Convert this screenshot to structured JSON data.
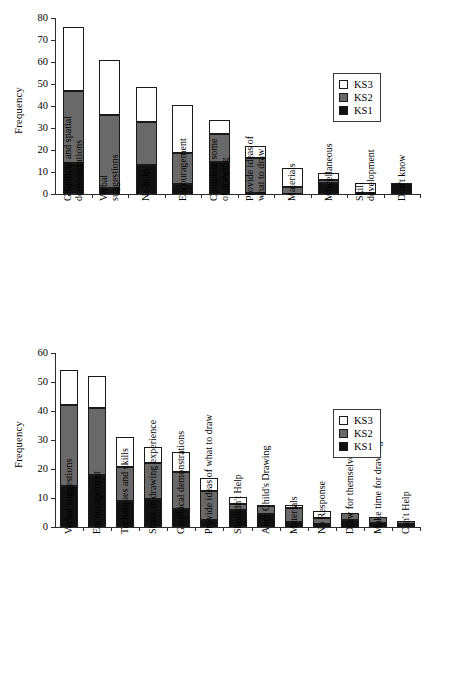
{
  "figure": {
    "background": "#ffffff",
    "colors": {
      "ks1": "#111111",
      "ks2": "#696969",
      "ks3": "#ffffff",
      "axis": "#2b2b2b"
    }
  },
  "legend": {
    "position": "top-right",
    "items": [
      {
        "label": "KS3",
        "color": "#ffffff"
      },
      {
        "label": "KS2",
        "color": "#696969"
      },
      {
        "label": "KS1",
        "color": "#111111"
      }
    ]
  },
  "chart_data": [
    {
      "id": "top",
      "type": "bar",
      "stacked": true,
      "title": "",
      "xlabel": "",
      "ylabel": "Frequency",
      "ylim": [
        0,
        80
      ],
      "yticks": [
        0,
        10,
        20,
        30,
        40,
        50,
        60,
        70,
        80
      ],
      "ytick_labels": [
        "0",
        "10",
        "20",
        "30",
        "40",
        "50",
        "60",
        "70",
        "80"
      ],
      "grid": false,
      "legend_entries": [
        "KS3",
        "KS2",
        "KS1"
      ],
      "categories": [
        "Graphical and spatial demonstrations",
        "Verbal suggestions",
        "No help",
        "Encouragement",
        "Complete some of drawing",
        "Provide ideas of what to draw",
        "Materials",
        "Miscellaneous",
        "Skill development",
        "Don't know"
      ],
      "category_lines": [
        [
          "Graphical and spatial",
          "demonstrations"
        ],
        [
          "Verbal",
          "suggestions"
        ],
        [
          "No help"
        ],
        [
          "Encouragement"
        ],
        [
          "Complete some",
          "of drawing"
        ],
        [
          "Provide ideas of",
          "what to draw"
        ],
        [
          "Materials"
        ],
        [
          "Miscellaneous"
        ],
        [
          "Skill",
          "development"
        ],
        [
          "Don't know"
        ]
      ],
      "series": [
        {
          "name": "KS1",
          "values": [
            14,
            3,
            13,
            4.5,
            14.5,
            0.5,
            0,
            5,
            0,
            5
          ]
        },
        {
          "name": "KS2",
          "values": [
            33,
            33,
            19.5,
            14,
            12.5,
            16,
            3.5,
            1.5,
            0.5,
            0
          ]
        },
        {
          "name": "KS3",
          "values": [
            29,
            25,
            16,
            22,
            6.5,
            5.5,
            8.5,
            3,
            4.5,
            0
          ]
        }
      ],
      "totals": [
        76,
        61,
        48.5,
        40.5,
        33.5,
        22,
        12,
        9.5,
        5,
        5
      ]
    },
    {
      "id": "bottom",
      "type": "bar",
      "stacked": true,
      "title": "",
      "xlabel": "",
      "ylabel": "Frequency",
      "ylim": [
        0,
        60
      ],
      "yticks": [
        0,
        10,
        20,
        30,
        40,
        50,
        60
      ],
      "ytick_labels": [
        "0",
        "10",
        "20",
        "30",
        "40",
        "50",
        "60"
      ],
      "grid": false,
      "legend_entries": [
        "KS3",
        "KS2",
        "KS1"
      ],
      "categories": [
        "Verbal suggestions",
        "Encouragement",
        "Techniques and skills",
        "Share in drawing experience",
        "Graphical demonstrations",
        "Provide ideas of what to draw",
        "Shouldn't Help",
        "Alter Child's Drawing",
        "Materials",
        "No Response",
        "Draw for themselves",
        "Make time for drawing",
        "Can't Help"
      ],
      "category_lines": [
        [
          "Verbal suggestions"
        ],
        [
          "Encouragement"
        ],
        [
          "Techniques and skills"
        ],
        [
          "Share in drawing experience"
        ],
        [
          "Graphical demonstrations"
        ],
        [
          "Provide ideas of what to draw"
        ],
        [
          "Shouldn't Help"
        ],
        [
          "Alter Child's Drawing"
        ],
        [
          "Materials"
        ],
        [
          "No Response"
        ],
        [
          "Draw for themselves"
        ],
        [
          "Make time for drawing"
        ],
        [
          "Can't Help"
        ]
      ],
      "series": [
        {
          "name": "KS1",
          "values": [
            14,
            18,
            9,
            9.5,
            6.5,
            2.5,
            6,
            4.5,
            1.5,
            1,
            2.5,
            1.5,
            1
          ]
        },
        {
          "name": "KS2",
          "values": [
            28,
            23,
            11.5,
            12.5,
            12.5,
            10,
            2,
            2.5,
            5,
            2,
            2.5,
            2,
            1
          ]
        },
        {
          "name": "KS3",
          "values": [
            12,
            11,
            10.5,
            5.5,
            7,
            4.5,
            2.5,
            0.5,
            1,
            2.5,
            0,
            0,
            0
          ]
        }
      ],
      "totals": [
        54,
        52,
        31,
        27.5,
        26,
        17,
        10.5,
        7.5,
        7.5,
        5.5,
        5,
        3.5,
        2
      ]
    }
  ]
}
